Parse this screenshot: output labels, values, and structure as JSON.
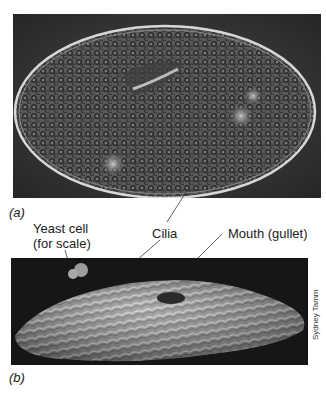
{
  "figure": {
    "panel_a": {
      "letter": "(a)",
      "description": "Phase-contrast light micrograph of an oval ciliate cell filled with granular vacuoles"
    },
    "panel_b": {
      "letter": "(b)",
      "description": "Scanning electron micrograph of ciliate showing rows of cilia",
      "credit": "Sydney Tamm"
    },
    "labels": {
      "yeast_line1": "Yeast cell",
      "yeast_line2": "(for scale)",
      "cilia": "Cilia",
      "mouth": "Mouth (gullet)"
    }
  }
}
